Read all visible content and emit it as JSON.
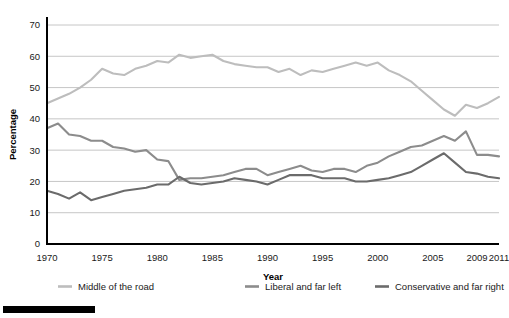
{
  "chart_data": {
    "type": "line",
    "title": "",
    "xlabel": "Year",
    "ylabel": "Percentage",
    "ylim": [
      0,
      70
    ],
    "ytick_step": 10,
    "yticks": [
      0,
      10,
      20,
      30,
      40,
      50,
      60,
      70
    ],
    "grid": true,
    "legend_position": "bottom",
    "xticks": [
      "1970",
      "1975",
      "1980",
      "1985",
      "1990",
      "1995",
      "2000",
      "2005",
      "2009",
      "2011"
    ],
    "x": [
      1970,
      1971,
      1972,
      1973,
      1974,
      1975,
      1976,
      1977,
      1978,
      1979,
      1980,
      1981,
      1982,
      1983,
      1984,
      1985,
      1986,
      1987,
      1988,
      1989,
      1990,
      1991,
      1992,
      1993,
      1994,
      1995,
      1996,
      1997,
      1998,
      1999,
      2000,
      2001,
      2002,
      2003,
      2004,
      2005,
      2006,
      2007,
      2008,
      2009,
      2010,
      2011
    ],
    "series": [
      {
        "name": "Middle of the road",
        "color": "#bdbdbd",
        "values": [
          45.0,
          46.5,
          48.0,
          50.0,
          52.5,
          56.0,
          54.5,
          54.0,
          56.0,
          57.0,
          58.5,
          58.0,
          60.5,
          59.5,
          60.0,
          60.5,
          58.5,
          57.5,
          57.0,
          56.5,
          56.5,
          55.0,
          56.0,
          54.0,
          55.5,
          55.0,
          56.0,
          57.0,
          58.0,
          57.0,
          58.0,
          55.5,
          54.0,
          52.0,
          49.0,
          46.0,
          43.0,
          41.0,
          44.5,
          43.5,
          45.0,
          47.0
        ]
      },
      {
        "name": "Liberal and far left",
        "color": "#8c8c8c",
        "values": [
          37.0,
          38.5,
          35.0,
          34.5,
          33.0,
          33.0,
          31.0,
          30.5,
          29.5,
          30.0,
          27.0,
          26.5,
          20.5,
          21.0,
          21.0,
          21.5,
          22.0,
          23.0,
          24.0,
          24.0,
          22.0,
          23.0,
          24.0,
          25.0,
          23.5,
          23.0,
          24.0,
          24.0,
          23.0,
          25.0,
          26.0,
          28.0,
          29.5,
          31.0,
          31.5,
          33.0,
          34.5,
          33.0,
          36.0,
          28.5,
          28.5,
          28.0
        ]
      },
      {
        "name": "Conservative and far right",
        "color": "#6b6b6b",
        "values": [
          17.0,
          16.0,
          14.5,
          16.5,
          14.0,
          15.0,
          16.0,
          17.0,
          17.5,
          18.0,
          19.0,
          19.0,
          21.5,
          19.5,
          19.0,
          19.5,
          20.0,
          21.0,
          20.5,
          20.0,
          19.0,
          20.5,
          22.0,
          22.0,
          22.0,
          21.0,
          21.0,
          21.0,
          20.0,
          20.0,
          20.5,
          21.0,
          22.0,
          23.0,
          25.0,
          27.0,
          29.0,
          26.0,
          23.0,
          22.5,
          21.5,
          21.0
        ]
      }
    ]
  },
  "legend": {
    "items": [
      {
        "label": "Middle of the road"
      },
      {
        "label": "Liberal and far left"
      },
      {
        "label": "Conservative and far right"
      }
    ]
  }
}
